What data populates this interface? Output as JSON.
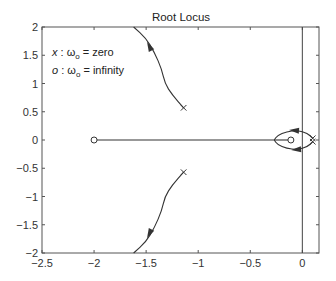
{
  "chart_data": {
    "type": "line",
    "title": "Root Locus",
    "xlabel": "",
    "ylabel": "",
    "xlim": [
      -2.5,
      0.16
    ],
    "ylim": [
      -2,
      2
    ],
    "grid": false,
    "x_ticks": [
      -2.5,
      -2,
      -1.5,
      -1,
      -0.5,
      0
    ],
    "x_tick_labels": [
      "−2.5",
      "−2",
      "−1.5",
      "−1",
      "−0.5",
      "0"
    ],
    "y_ticks": [
      2,
      1.5,
      1,
      0.5,
      0,
      -0.5,
      -1,
      -1.5,
      -2
    ],
    "y_tick_labels": [
      "2",
      "1.5",
      "1",
      "0.5",
      "0",
      "−0.5",
      "−1",
      "−1.5",
      "−2"
    ],
    "annotations": [
      {
        "marker": "x",
        "text": "x : ω₀ = zero"
      },
      {
        "marker": "o",
        "text": "o : ω₀ = infinity"
      }
    ],
    "imaginary_axis_line_x": 0,
    "poles_x_marker": [
      {
        "re": -1.14,
        "im": 0.57
      },
      {
        "re": -1.14,
        "im": -0.57
      },
      {
        "re": 0.1,
        "im": 0.03
      },
      {
        "re": 0.1,
        "im": -0.03
      }
    ],
    "zeros_o_marker": [
      {
        "re": -2.0,
        "im": 0.0
      },
      {
        "re": -0.11,
        "im": 0.0
      }
    ],
    "series": [
      {
        "name": "upper-branch",
        "x": [
          -1.14,
          -1.25,
          -1.32,
          -1.35,
          -1.42,
          -1.5,
          -1.62
        ],
        "y": [
          0.57,
          0.8,
          1.0,
          1.25,
          1.55,
          1.8,
          2.0
        ],
        "arrow_at": {
          "re": -1.47,
          "im": 1.66
        }
      },
      {
        "name": "lower-branch",
        "x": [
          -1.14,
          -1.25,
          -1.32,
          -1.35,
          -1.42,
          -1.5,
          -1.62
        ],
        "y": [
          -0.57,
          -0.8,
          -1.0,
          -1.25,
          -1.55,
          -1.8,
          -2.0
        ],
        "arrow_at": {
          "re": -1.47,
          "im": -1.66
        }
      },
      {
        "name": "real-axis-segment",
        "x": [
          -2.0,
          -0.27
        ],
        "y": [
          0,
          0
        ]
      },
      {
        "name": "loop-upper",
        "x": [
          0.1,
          0.05,
          -0.05,
          -0.15,
          -0.24,
          -0.27
        ],
        "y": [
          0.03,
          0.12,
          0.17,
          0.15,
          0.08,
          0.0
        ],
        "arrow_at": {
          "re": -0.08,
          "im": 0.17
        }
      },
      {
        "name": "loop-lower",
        "x": [
          0.1,
          0.05,
          -0.05,
          -0.15,
          -0.24,
          -0.27
        ],
        "y": [
          -0.03,
          -0.12,
          -0.17,
          -0.15,
          -0.08,
          0.0
        ],
        "arrow_at": {
          "re": -0.06,
          "im": -0.17
        }
      },
      {
        "name": "inner-branch",
        "x": [
          -0.27,
          -0.11
        ],
        "y": [
          0,
          0
        ]
      }
    ]
  }
}
